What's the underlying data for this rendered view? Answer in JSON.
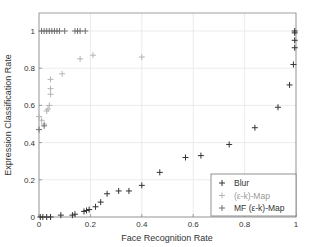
{
  "chart_data": {
    "type": "scatter",
    "title": "",
    "xlabel": "Face Recognition Rate",
    "ylabel": "Expression Classification Rate",
    "xlim": [
      0,
      1
    ],
    "ylim": [
      0,
      1.1
    ],
    "xticks": [
      "0",
      "0.2",
      "0.4",
      "0.6",
      "0.8",
      "1"
    ],
    "yticks": [
      "0",
      "0.2",
      "0.4",
      "0.6",
      "0.8",
      "1"
    ],
    "grid": true,
    "legend_position": "lower right",
    "series": [
      {
        "name": "Blur",
        "color": "#333333",
        "marker": "+",
        "points": [
          [
            0.005,
            0.0
          ],
          [
            0.015,
            0.0
          ],
          [
            0.03,
            0.0
          ],
          [
            0.045,
            0.0
          ],
          [
            0.085,
            0.01
          ],
          [
            0.13,
            0.01
          ],
          [
            0.14,
            0.015
          ],
          [
            0.175,
            0.03
          ],
          [
            0.185,
            0.035
          ],
          [
            0.195,
            0.04
          ],
          [
            0.22,
            0.055
          ],
          [
            0.24,
            0.08
          ],
          [
            0.265,
            0.125
          ],
          [
            0.31,
            0.14
          ],
          [
            0.35,
            0.14
          ],
          [
            0.4,
            0.17
          ],
          [
            0.47,
            0.24
          ],
          [
            0.57,
            0.32
          ],
          [
            0.63,
            0.33
          ],
          [
            0.74,
            0.39
          ],
          [
            0.84,
            0.48
          ],
          [
            0.93,
            0.59
          ],
          [
            0.975,
            0.71
          ],
          [
            0.99,
            0.82
          ],
          [
            0.995,
            0.91
          ],
          [
            0.995,
            0.95
          ],
          [
            0.995,
            0.99
          ],
          [
            0.995,
            1.0
          ]
        ]
      },
      {
        "name": "(ε-k)-Map",
        "color": "#b4b4b4",
        "marker": "+",
        "points": [
          [
            0.0,
            0.54
          ],
          [
            0.01,
            0.52
          ],
          [
            0.02,
            0.5
          ],
          [
            0.03,
            0.57
          ],
          [
            0.035,
            0.58
          ],
          [
            0.04,
            0.6
          ],
          [
            0.045,
            0.66
          ],
          [
            0.045,
            0.69
          ],
          [
            0.045,
            0.74
          ],
          [
            0.09,
            0.77
          ],
          [
            0.16,
            0.85
          ],
          [
            0.21,
            0.87
          ],
          [
            0.4,
            0.86
          ]
        ]
      },
      {
        "name": "MF (ε-k)-Map",
        "color": "#707070",
        "marker": "+",
        "points": [
          [
            0.01,
            1.0
          ],
          [
            0.02,
            1.0
          ],
          [
            0.03,
            1.0
          ],
          [
            0.04,
            1.0
          ],
          [
            0.05,
            1.0
          ],
          [
            0.06,
            1.0
          ],
          [
            0.07,
            1.0
          ],
          [
            0.08,
            1.0
          ],
          [
            0.1,
            1.0
          ],
          [
            0.14,
            1.0
          ],
          [
            0.15,
            1.0
          ],
          [
            0.16,
            1.0
          ],
          [
            0.18,
            1.0
          ],
          [
            0.0,
            0.47
          ],
          [
            0.02,
            0.49
          ]
        ]
      }
    ]
  },
  "legend": {
    "items": [
      {
        "label": "Blur",
        "color": "#333333"
      },
      {
        "label": "(ε-k)-Map",
        "color": "#b4b4b4"
      },
      {
        "label": "MF (ε-k)-Map",
        "color": "#707070"
      }
    ]
  },
  "axes": {
    "xlabel": "Face Recognition Rate",
    "ylabel": "Expression Classification Rate"
  }
}
